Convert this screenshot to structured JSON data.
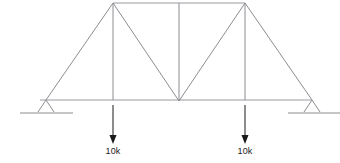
{
  "diagram": {
    "type": "truss-free-body-diagram",
    "canvas": {
      "width": 340,
      "height": 163
    },
    "colors": {
      "member": "#8c8c93",
      "load": "#1a1a1a",
      "background": "#ffffff"
    },
    "nodes": {
      "left_support": {
        "x": 46,
        "y": 100
      },
      "right_support": {
        "x": 312,
        "y": 100
      },
      "bottom_left_panel": {
        "x": 113,
        "y": 100
      },
      "bottom_center": {
        "x": 179,
        "y": 101
      },
      "bottom_right_panel": {
        "x": 245,
        "y": 100
      },
      "top_left": {
        "x": 113,
        "y": 3
      },
      "top_center": {
        "x": 179,
        "y": 3
      },
      "top_right": {
        "x": 245,
        "y": 3
      },
      "bottom_chord_left_end": {
        "x": 40,
        "y": 100
      },
      "bottom_chord_right_end": {
        "x": 311,
        "y": 100
      }
    },
    "members": [
      {
        "name": "top-chord",
        "x1": 113,
        "y1": 3,
        "x2": 245,
        "y2": 3
      },
      {
        "name": "bottom-chord",
        "x1": 40,
        "y1": 100,
        "x2": 311,
        "y2": 100
      },
      {
        "name": "left-end-post",
        "x1": 46,
        "y1": 100,
        "x2": 113,
        "y2": 3
      },
      {
        "name": "right-end-post",
        "x1": 245,
        "y1": 3,
        "x2": 312,
        "y2": 100
      },
      {
        "name": "vertical-left",
        "x1": 113,
        "y1": 3,
        "x2": 113,
        "y2": 100
      },
      {
        "name": "vertical-center",
        "x1": 179,
        "y1": 3,
        "x2": 179,
        "y2": 101
      },
      {
        "name": "vertical-right",
        "x1": 245,
        "y1": 3,
        "x2": 245,
        "y2": 100
      },
      {
        "name": "diagonal-left",
        "x1": 113,
        "y1": 3,
        "x2": 179,
        "y2": 101
      },
      {
        "name": "diagonal-right",
        "x1": 179,
        "y1": 101,
        "x2": 245,
        "y2": 3
      }
    ],
    "supports": [
      {
        "name": "left-support",
        "kind": "pin",
        "apex_x": 46,
        "apex_y": 100,
        "base_left_x": 38,
        "base_right_x": 54,
        "base_y": 112,
        "ground_x1": 20,
        "ground_x2": 73,
        "ground_y": 113
      },
      {
        "name": "right-support",
        "kind": "roller",
        "apex_x": 312,
        "apex_y": 100,
        "base_left_x": 304,
        "base_right_x": 320,
        "base_y": 112,
        "ground_x1": 288,
        "ground_x2": 340,
        "ground_y": 113
      }
    ],
    "loads": [
      {
        "name": "load-left",
        "label": "10k",
        "magnitude": 10,
        "unit": "k",
        "direction": "down",
        "x": 113,
        "shaft_top_y": 105,
        "shaft_bottom_y": 137,
        "head_tip_y": 144,
        "label_x": 113,
        "label_y": 146
      },
      {
        "name": "load-right",
        "label": "10k",
        "magnitude": 10,
        "unit": "k",
        "direction": "down",
        "x": 245,
        "shaft_top_y": 105,
        "shaft_bottom_y": 137,
        "head_tip_y": 144,
        "label_x": 245,
        "label_y": 146
      }
    ]
  }
}
